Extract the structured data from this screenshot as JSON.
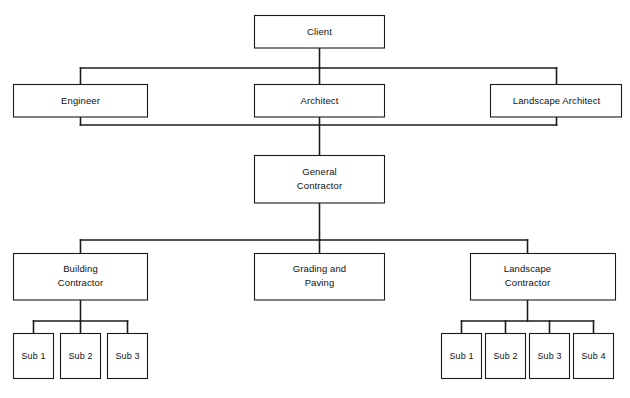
{
  "diagram": {
    "type": "org-chart",
    "background_color": "#ffffff",
    "line_color": "#1b1b1b",
    "box_fill": "#ffffff"
  },
  "nodes": {
    "client": {
      "label": "Client"
    },
    "engineer": {
      "label": "Engineer"
    },
    "architect": {
      "label": "Architect"
    },
    "landscape_architect": {
      "label": "Landscape Architect"
    },
    "general_contractor": {
      "line1": "General",
      "line2": "Contractor"
    },
    "building_contractor": {
      "line1": "Building",
      "line2": "Contractor"
    },
    "grading_paving": {
      "line1": "Grading and",
      "line2": "Paving"
    },
    "landscape_contractor": {
      "line1": "Landscape",
      "line2": "Contractor"
    }
  },
  "building_subs": [
    {
      "label": "Sub 1"
    },
    {
      "label": "Sub 2"
    },
    {
      "label": "Sub 3"
    }
  ],
  "landscape_subs": [
    {
      "label": "Sub 1"
    },
    {
      "label": "Sub 2"
    },
    {
      "label": "Sub 3"
    },
    {
      "label": "Sub 4"
    }
  ],
  "caption": {
    "text": ""
  }
}
